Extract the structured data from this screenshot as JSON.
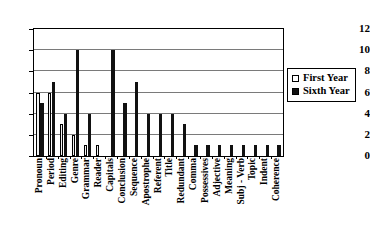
{
  "chart_data": {
    "type": "bar",
    "title": "",
    "xlabel": "",
    "ylabel": "",
    "ylim": [
      0,
      12
    ],
    "yticks": [
      0,
      2,
      4,
      6,
      8,
      10,
      12
    ],
    "grid": true,
    "legend_position": "right",
    "categories": [
      "Pronoun",
      "Period",
      "Editing",
      "Genre",
      "Grammar",
      "Reader",
      "Capitals",
      "Conclusion",
      "Sequence",
      "Apostrophe",
      "Referent",
      "Title",
      "Redundant",
      "Comma",
      "Possessives",
      "Adjective",
      "Meaning",
      "Subj - Verb",
      "Topic",
      "Indent",
      "Coherence"
    ],
    "series": [
      {
        "name": "First Year",
        "color": "#f2f2f2",
        "values": [
          6,
          6,
          3,
          2,
          1,
          1,
          0,
          0,
          0,
          0,
          0,
          0,
          0,
          0,
          0,
          0,
          0,
          0,
          0,
          0,
          0
        ]
      },
      {
        "name": "Sixth Year",
        "color": "#111111",
        "values": [
          5,
          7,
          4,
          10,
          4,
          0,
          10,
          5,
          7,
          4,
          4,
          4,
          3,
          1,
          1,
          1,
          1,
          1,
          1,
          1,
          1
        ]
      }
    ]
  },
  "legend": {
    "entries": [
      {
        "label": "First Year",
        "swatch": "hollow-square-icon"
      },
      {
        "label": "Sixth Year",
        "swatch": "filled-square-icon"
      }
    ]
  }
}
